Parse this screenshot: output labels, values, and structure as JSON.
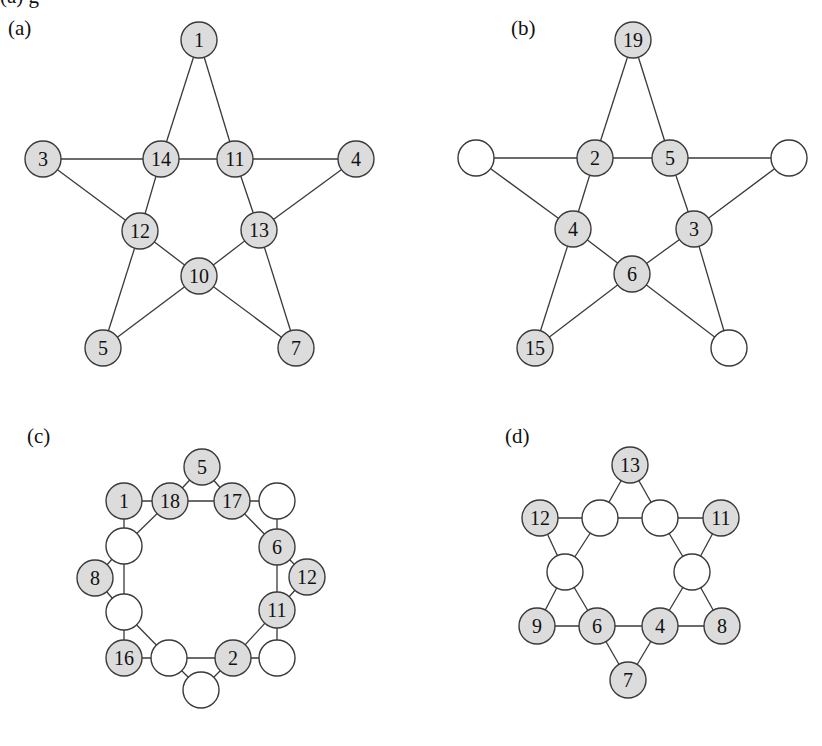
{
  "figure": {
    "cutoff_caption": "(a)                                          g",
    "style": {
      "filled_color": "#dcdcdc",
      "empty_color": "#ffffff",
      "stroke_color": "#3a3a3a",
      "edge_color": "#3a3a3a",
      "text_color": "#111111",
      "node_radius": 18
    },
    "panels": [
      {
        "id": "a",
        "label": "(a)",
        "label_pos": [
          8,
          18
        ],
        "shape": "pentagram",
        "nodes": [
          {
            "id": "a1",
            "x": 199,
            "y": 40,
            "label": "1",
            "filled": true
          },
          {
            "id": "a3",
            "x": 43,
            "y": 159,
            "label": "3",
            "filled": true
          },
          {
            "id": "a14",
            "x": 161,
            "y": 159,
            "label": "14",
            "filled": true
          },
          {
            "id": "a11",
            "x": 235,
            "y": 159,
            "label": "11",
            "filled": true
          },
          {
            "id": "a4",
            "x": 356,
            "y": 159,
            "label": "4",
            "filled": true
          },
          {
            "id": "a12",
            "x": 140,
            "y": 231,
            "label": "12",
            "filled": true
          },
          {
            "id": "a13",
            "x": 259,
            "y": 230,
            "label": "13",
            "filled": true
          },
          {
            "id": "a10",
            "x": 199,
            "y": 276,
            "label": "10",
            "filled": true
          },
          {
            "id": "a5",
            "x": 103,
            "y": 348,
            "label": "5",
            "filled": true
          },
          {
            "id": "a7",
            "x": 296,
            "y": 348,
            "label": "7",
            "filled": true
          }
        ],
        "edges": [
          [
            "a1",
            "a14"
          ],
          [
            "a1",
            "a11"
          ],
          [
            "a3",
            "a14"
          ],
          [
            "a14",
            "a11"
          ],
          [
            "a11",
            "a4"
          ],
          [
            "a3",
            "a12"
          ],
          [
            "a4",
            "a13"
          ],
          [
            "a14",
            "a12"
          ],
          [
            "a11",
            "a13"
          ],
          [
            "a12",
            "a10"
          ],
          [
            "a13",
            "a10"
          ],
          [
            "a12",
            "a5"
          ],
          [
            "a13",
            "a7"
          ],
          [
            "a10",
            "a5"
          ],
          [
            "a10",
            "a7"
          ]
        ]
      },
      {
        "id": "b",
        "label": "(b)",
        "label_pos": [
          511,
          18
        ],
        "shape": "pentagram",
        "nodes": [
          {
            "id": "b19",
            "x": 633,
            "y": 40,
            "label": "19",
            "filled": true
          },
          {
            "id": "bL",
            "x": 476,
            "y": 158,
            "label": "",
            "filled": false
          },
          {
            "id": "b2",
            "x": 595,
            "y": 158,
            "label": "2",
            "filled": true
          },
          {
            "id": "b5",
            "x": 670,
            "y": 158,
            "label": "5",
            "filled": true
          },
          {
            "id": "bR",
            "x": 789,
            "y": 158,
            "label": "",
            "filled": false
          },
          {
            "id": "b4",
            "x": 573,
            "y": 229,
            "label": "4",
            "filled": true
          },
          {
            "id": "b3",
            "x": 694,
            "y": 229,
            "label": "3",
            "filled": true
          },
          {
            "id": "b6",
            "x": 632,
            "y": 274,
            "label": "6",
            "filled": true
          },
          {
            "id": "b15",
            "x": 535,
            "y": 348,
            "label": "15",
            "filled": true
          },
          {
            "id": "bBR",
            "x": 729,
            "y": 348,
            "label": "",
            "filled": false
          }
        ],
        "edges": [
          [
            "b19",
            "b2"
          ],
          [
            "b19",
            "b5"
          ],
          [
            "bL",
            "b2"
          ],
          [
            "b2",
            "b5"
          ],
          [
            "b5",
            "bR"
          ],
          [
            "bL",
            "b4"
          ],
          [
            "bR",
            "b3"
          ],
          [
            "b2",
            "b4"
          ],
          [
            "b5",
            "b3"
          ],
          [
            "b4",
            "b6"
          ],
          [
            "b3",
            "b6"
          ],
          [
            "b4",
            "b15"
          ],
          [
            "b3",
            "bBR"
          ],
          [
            "b6",
            "b15"
          ],
          [
            "b6",
            "bBR"
          ]
        ]
      },
      {
        "id": "c",
        "label": "(c)",
        "label_pos": [
          27,
          426
        ],
        "shape": "octagon-ring",
        "nodes": [
          {
            "id": "c5",
            "x": 202,
            "y": 467,
            "label": "5",
            "filled": true
          },
          {
            "id": "c1",
            "x": 124,
            "y": 501,
            "label": "1",
            "filled": true
          },
          {
            "id": "c18",
            "x": 170,
            "y": 501,
            "label": "18",
            "filled": true
          },
          {
            "id": "c17",
            "x": 232,
            "y": 501,
            "label": "17",
            "filled": true
          },
          {
            "id": "cTR",
            "x": 277,
            "y": 501,
            "label": "",
            "filled": false
          },
          {
            "id": "cLU",
            "x": 124,
            "y": 546,
            "label": "",
            "filled": false
          },
          {
            "id": "c6",
            "x": 277,
            "y": 547,
            "label": "6",
            "filled": true
          },
          {
            "id": "c8",
            "x": 95,
            "y": 578,
            "label": "8",
            "filled": true
          },
          {
            "id": "c12",
            "x": 307,
            "y": 577,
            "label": "12",
            "filled": true
          },
          {
            "id": "cLL",
            "x": 124,
            "y": 612,
            "label": "",
            "filled": false
          },
          {
            "id": "c11",
            "x": 277,
            "y": 610,
            "label": "11",
            "filled": true
          },
          {
            "id": "c16",
            "x": 124,
            "y": 658,
            "label": "16",
            "filled": true
          },
          {
            "id": "cBL",
            "x": 169,
            "y": 658,
            "label": "",
            "filled": false
          },
          {
            "id": "c2",
            "x": 233,
            "y": 658,
            "label": "2",
            "filled": true
          },
          {
            "id": "cBR",
            "x": 277,
            "y": 658,
            "label": "",
            "filled": false
          },
          {
            "id": "cB",
            "x": 201,
            "y": 690,
            "label": "",
            "filled": false
          }
        ],
        "edges": [
          [
            "c18",
            "c17"
          ],
          [
            "c17",
            "c6"
          ],
          [
            "c6",
            "c11"
          ],
          [
            "c11",
            "c2"
          ],
          [
            "c2",
            "cBL"
          ],
          [
            "cBL",
            "cLL"
          ],
          [
            "cLL",
            "cLU"
          ],
          [
            "cLU",
            "c18"
          ],
          [
            "c5",
            "c18"
          ],
          [
            "c5",
            "c17"
          ],
          [
            "cTR",
            "c17"
          ],
          [
            "cTR",
            "c6"
          ],
          [
            "c12",
            "c6"
          ],
          [
            "c12",
            "c11"
          ],
          [
            "cBR",
            "c11"
          ],
          [
            "cBR",
            "c2"
          ],
          [
            "cB",
            "c2"
          ],
          [
            "cB",
            "cBL"
          ],
          [
            "c16",
            "cBL"
          ],
          [
            "c16",
            "cLL"
          ],
          [
            "c8",
            "cLL"
          ],
          [
            "c8",
            "cLU"
          ],
          [
            "c1",
            "cLU"
          ],
          [
            "c1",
            "c18"
          ]
        ]
      },
      {
        "id": "d",
        "label": "(d)",
        "label_pos": [
          505,
          426
        ],
        "shape": "hexagram",
        "nodes": [
          {
            "id": "d13",
            "x": 630,
            "y": 465,
            "label": "13",
            "filled": true
          },
          {
            "id": "d12",
            "x": 540,
            "y": 518,
            "label": "12",
            "filled": true
          },
          {
            "id": "dTL",
            "x": 600,
            "y": 518,
            "label": "",
            "filled": false
          },
          {
            "id": "dTR",
            "x": 660,
            "y": 518,
            "label": "",
            "filled": false
          },
          {
            "id": "d11",
            "x": 721,
            "y": 518,
            "label": "11",
            "filled": true
          },
          {
            "id": "dML",
            "x": 565,
            "y": 572,
            "label": "",
            "filled": false
          },
          {
            "id": "dMR",
            "x": 692,
            "y": 572,
            "label": "",
            "filled": false
          },
          {
            "id": "d9",
            "x": 537,
            "y": 626,
            "label": "9",
            "filled": true
          },
          {
            "id": "d6",
            "x": 597,
            "y": 626,
            "label": "6",
            "filled": true
          },
          {
            "id": "d4",
            "x": 660,
            "y": 626,
            "label": "4",
            "filled": true
          },
          {
            "id": "d8",
            "x": 722,
            "y": 626,
            "label": "8",
            "filled": true
          },
          {
            "id": "d7",
            "x": 628,
            "y": 680,
            "label": "7",
            "filled": true
          }
        ],
        "edges": [
          [
            "d13",
            "dTL"
          ],
          [
            "d13",
            "dTR"
          ],
          [
            "d12",
            "dTL"
          ],
          [
            "dTL",
            "dTR"
          ],
          [
            "dTR",
            "d11"
          ],
          [
            "d12",
            "dML"
          ],
          [
            "dTL",
            "dML"
          ],
          [
            "d11",
            "dMR"
          ],
          [
            "dTR",
            "dMR"
          ],
          [
            "dML",
            "d9"
          ],
          [
            "dML",
            "d6"
          ],
          [
            "dMR",
            "d4"
          ],
          [
            "dMR",
            "d8"
          ],
          [
            "d9",
            "d6"
          ],
          [
            "d6",
            "d4"
          ],
          [
            "d4",
            "d8"
          ],
          [
            "d6",
            "d7"
          ],
          [
            "d4",
            "d7"
          ]
        ]
      }
    ]
  }
}
